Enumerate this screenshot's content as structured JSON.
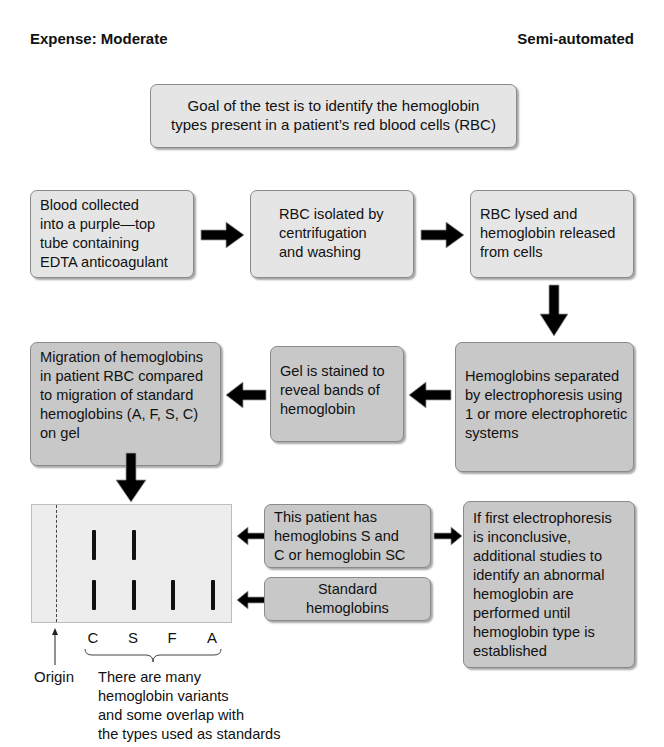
{
  "header": {
    "expense": "Expense: Moderate",
    "automation": "Semi-automated"
  },
  "goal": {
    "lines": [
      "Goal of the test is to identify the hemoglobin",
      "types present in a patient’s red blood cells (RBC)"
    ]
  },
  "steps": [
    {
      "id": "collect",
      "lines": [
        "Blood collected",
        "into a purple—top",
        "tube containing",
        "EDTA anticoagulant"
      ]
    },
    {
      "id": "isolate",
      "lines": [
        "RBC isolated by",
        "centrifugation",
        "and washing"
      ]
    },
    {
      "id": "lyse",
      "lines": [
        "RBC lysed and",
        "hemoglobin released",
        "from cells"
      ]
    },
    {
      "id": "separate",
      "lines": [
        "Hemoglobins separated",
        "by electrophoresis using",
        "1 or more electrophoretic",
        "systems"
      ]
    },
    {
      "id": "stain",
      "lines": [
        "Gel is stained to",
        "reveal bands of",
        "hemoglobin"
      ]
    },
    {
      "id": "compare",
      "lines": [
        "Migration of hemoglobins",
        "in patient RBC compared",
        "to migration of standard",
        "hemoglobins (A, F, S, C)",
        "on gel"
      ]
    }
  ],
  "gel": {
    "lanes": [
      "C",
      "S",
      "F",
      "A"
    ],
    "patient_bands": [
      "C",
      "S"
    ],
    "standard_bands": [
      "C",
      "S",
      "F",
      "A"
    ],
    "origin_label": "Origin",
    "caption": [
      "There are many",
      "hemoglobin variants",
      "and some overlap with",
      "the types used as standards"
    ]
  },
  "annotations": {
    "patient": [
      "This patient has",
      "hemoglobins S and",
      "C or hemoglobin SC"
    ],
    "standard": [
      "Standard",
      "hemoglobins"
    ],
    "followup": [
      "If first electrophoresis",
      "is inconclusive,",
      "additional studies to",
      "identify an abnormal",
      "hemoglobin are",
      "performed until",
      "hemoglobin type is",
      "established"
    ]
  },
  "colors": {
    "light_box": "#e5e5e5",
    "dark_box": "#c8c8c8",
    "arrow": "#000000",
    "gel": "#ededed"
  }
}
